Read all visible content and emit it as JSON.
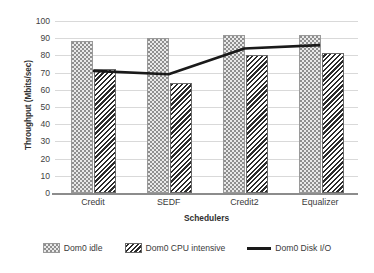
{
  "chart_data": {
    "type": "bar",
    "title": "",
    "subtitle": "",
    "xlabel": "Schedulers",
    "ylabel": "Throughput (Mbits/sec)",
    "categories": [
      "Credit",
      "SEDF",
      "Credit2",
      "Equalizer"
    ],
    "ylim": [
      0,
      100
    ],
    "ytick_interval": 10,
    "yticks": [
      "100",
      "90",
      "80",
      "70",
      "60",
      "50",
      "40",
      "30",
      "20",
      "10",
      "0"
    ],
    "ytick_values": [
      100,
      90,
      80,
      70,
      60,
      50,
      40,
      30,
      20,
      10,
      0
    ],
    "grid": true,
    "grid_axis": "y",
    "legend_position": "bottom",
    "series": [
      {
        "name": "Dom0 idle",
        "type": "bar",
        "pattern": "dotted",
        "color": "#e9e9e9",
        "edge_color": "#9a9a9a",
        "values": [
          87,
          89,
          90.5,
          90.5
        ]
      },
      {
        "name": "Dom0 CPU intensive",
        "type": "bar",
        "pattern": "diagonal-hatch",
        "color": "#2b2b2b",
        "edge_color": "#6a6a6a",
        "values": [
          71,
          63,
          79,
          80
        ]
      },
      {
        "name": "Dom0 Disk I/O",
        "type": "line",
        "color": "#1a1a1a",
        "line_width": 2.6,
        "values": [
          71,
          69,
          84,
          86
        ]
      }
    ]
  },
  "legend": {
    "items": [
      {
        "label": "Dom0 idle",
        "marker": "dotted-swatch"
      },
      {
        "label": "Dom0 CPU intensive",
        "marker": "hatched-swatch"
      },
      {
        "label": "Dom0 Disk I/O",
        "marker": "line-swatch"
      }
    ]
  }
}
